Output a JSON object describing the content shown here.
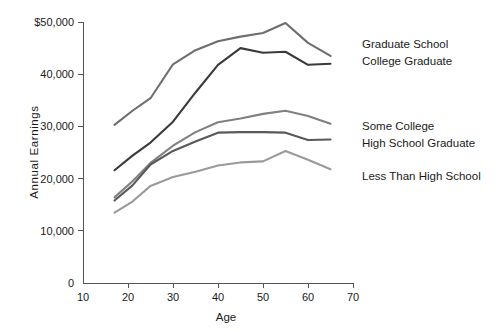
{
  "chart_data": {
    "type": "line",
    "title": "",
    "xlabel": "Age",
    "ylabel": "Annual Earnings",
    "xlim": [
      10,
      70
    ],
    "ylim": [
      0,
      50000
    ],
    "grid": false,
    "legend_position": "right-inline",
    "xticks": [
      10,
      20,
      30,
      40,
      50,
      60,
      70
    ],
    "xtick_labels": [
      "10",
      "20",
      "30",
      "40",
      "50",
      "60",
      "70"
    ],
    "yticks": [
      0,
      10000,
      20000,
      30000,
      40000,
      50000
    ],
    "ytick_labels": [
      "0",
      "10,000",
      "20,000",
      "30,000",
      "40,000",
      "$50,000"
    ],
    "series": [
      {
        "name": "Graduate School",
        "color": "#6e6e6e",
        "x": [
          17,
          21,
          25,
          30,
          35,
          40,
          45,
          50,
          55,
          60,
          65
        ],
        "values": [
          30300,
          33000,
          35400,
          41900,
          44600,
          46300,
          47200,
          47900,
          49800,
          46000,
          43500
        ]
      },
      {
        "name": "College Graduate",
        "color": "#3a3a3a",
        "x": [
          17,
          21,
          25,
          30,
          35,
          40,
          45,
          50,
          55,
          60,
          65
        ],
        "values": [
          21600,
          24400,
          26900,
          30900,
          36500,
          41800,
          45000,
          44100,
          44300,
          41800,
          42000
        ]
      },
      {
        "name": "Some College",
        "color": "#808080",
        "x": [
          17,
          21,
          25,
          30,
          35,
          40,
          45,
          50,
          55,
          60,
          65
        ],
        "values": [
          16400,
          19500,
          23000,
          26300,
          28900,
          30800,
          31500,
          32400,
          33000,
          32000,
          30500
        ]
      },
      {
        "name": "High School Graduate",
        "color": "#595959",
        "x": [
          17,
          21,
          25,
          30,
          35,
          40,
          45,
          50,
          55,
          60,
          65
        ],
        "values": [
          15800,
          18700,
          22700,
          25300,
          27100,
          28800,
          28900,
          28900,
          28800,
          27400,
          27500
        ]
      },
      {
        "name": "Less Than High School",
        "color": "#9a9a9a",
        "x": [
          17,
          21,
          25,
          30,
          35,
          40,
          45,
          50,
          55,
          60,
          65
        ],
        "values": [
          13500,
          15600,
          18600,
          20300,
          21300,
          22500,
          23100,
          23300,
          25300,
          23600,
          21800
        ]
      }
    ],
    "legend_labels": [
      {
        "text": "Graduate School",
        "x": 362,
        "y": 48
      },
      {
        "text": "College Graduate",
        "x": 362,
        "y": 65
      },
      {
        "text": "Some College",
        "x": 362,
        "y": 130
      },
      {
        "text": "High School Graduate",
        "x": 362,
        "y": 147
      },
      {
        "text": "Less Than High School",
        "x": 362,
        "y": 180
      }
    ]
  }
}
